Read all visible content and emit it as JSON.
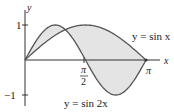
{
  "chart_data": {
    "type": "line",
    "title": "",
    "xlabel": "x",
    "ylabel": "y",
    "xlim": [
      0,
      3.3
    ],
    "ylim": [
      -1,
      1
    ],
    "x_ticks": [
      {
        "value": 1.5708,
        "label_num": "π",
        "label_den": "2"
      },
      {
        "value": 3.1416,
        "label": "π"
      }
    ],
    "y_ticks": [
      {
        "value": 1,
        "label": "1"
      },
      {
        "value": -1,
        "label": "−1"
      }
    ],
    "series": [
      {
        "name": "y = sin x",
        "x": [
          0,
          0.3927,
          0.7854,
          1.0472,
          1.1781,
          1.5708,
          1.9635,
          2.3562,
          2.7489,
          3.1416
        ],
        "values": [
          0,
          0.383,
          0.707,
          0.866,
          0.924,
          1.0,
          0.924,
          0.707,
          0.383,
          0
        ]
      },
      {
        "name": "y = sin 2x",
        "x": [
          0,
          0.3927,
          0.7854,
          1.0472,
          1.1781,
          1.5708,
          1.9635,
          2.3562,
          2.7489,
          3.1416
        ],
        "values": [
          0,
          0.707,
          1.0,
          0.866,
          0.707,
          0,
          -0.707,
          -1.0,
          -0.707,
          0
        ]
      }
    ],
    "annotations": [
      {
        "text": "y = sin x",
        "near": "upper right, pointing to sin x curve"
      },
      {
        "text": "y = sin 2x",
        "near": "bottom center, pointing to sin 2x curve"
      }
    ],
    "shaded_region": {
      "between": [
        "y = sin x",
        "y = sin 2x"
      ],
      "x_range": [
        0,
        3.1416
      ],
      "color": "#e4e4e4"
    },
    "grid": false,
    "legend": "none"
  },
  "labels": {
    "y_axis": "y",
    "x_axis": "x",
    "y_tick_top": "1",
    "y_tick_bottom": "−1",
    "pi_half_num": "π",
    "pi_half_den": "2",
    "pi": "π",
    "sinx_label": "y = sin x",
    "sin2x_label": "y = sin 2x"
  },
  "colors": {
    "curve": "#555555",
    "axis": "#333333",
    "fill": "#e4e4e4"
  }
}
